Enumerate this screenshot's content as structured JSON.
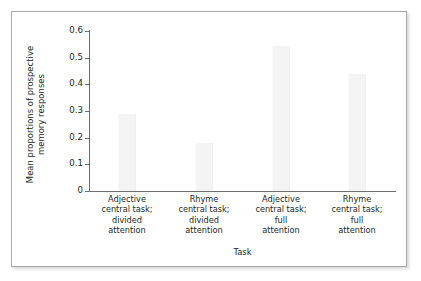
{
  "chart_data": {
    "type": "bar",
    "title": "",
    "xlabel": "Task",
    "ylabel": "Mean proportions of prospective memory responses",
    "ylabel_lines": [
      "Mean proportions of prospective",
      "memory responses"
    ],
    "categories": [
      "Adjective central task; divided attention",
      "Rhyme central task; divided attention",
      "Adjective central task; full attention",
      "Rhyme central task; full attention"
    ],
    "category_lines": [
      [
        "Adjective",
        "central task;",
        "divided",
        "attention"
      ],
      [
        "Rhyme",
        "central task;",
        "divided",
        "attention"
      ],
      [
        "Adjective",
        "central task;",
        "full",
        "attention"
      ],
      [
        "Rhyme",
        "central task;",
        "full",
        "attention"
      ]
    ],
    "values": [
      0.29,
      0.18,
      0.545,
      0.44
    ],
    "ylim": [
      0,
      0.6
    ],
    "ytick_values": [
      0,
      0.1,
      0.2,
      0.3,
      0.4,
      0.5,
      0.6
    ],
    "ytick_labels": [
      "0",
      "0.1",
      "0.2",
      "0.3",
      "0.4",
      "0.5",
      "0.6"
    ],
    "grid": false,
    "legend": "none",
    "bar_color": "#f4f4f4",
    "axis_color": "#6d6e71",
    "text_color": "#231f20",
    "frame_color": "#a8a8a8"
  }
}
